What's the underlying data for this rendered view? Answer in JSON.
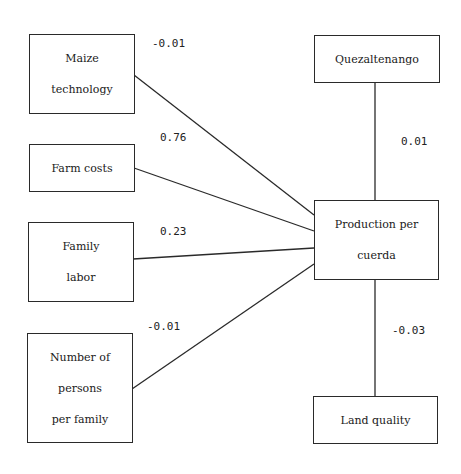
{
  "diagram": {
    "type": "path-diagram",
    "nodes": [
      {
        "id": "maize_technology",
        "lines": [
          "Maize",
          "technology"
        ]
      },
      {
        "id": "farm_costs",
        "lines": [
          "Farm costs"
        ]
      },
      {
        "id": "family_labor",
        "lines": [
          "Family",
          "labor"
        ]
      },
      {
        "id": "persons_per_family",
        "lines": [
          "Number of",
          "persons",
          "per family"
        ]
      },
      {
        "id": "quezaltenango",
        "lines": [
          "Quezaltenango"
        ]
      },
      {
        "id": "production_per_cuerda",
        "lines": [
          "Production per",
          "cuerda"
        ]
      },
      {
        "id": "land_quality",
        "lines": [
          "Land quality"
        ]
      }
    ],
    "edges": [
      {
        "from": "maize_technology",
        "to": "production_per_cuerda",
        "coefficient": "-0.01"
      },
      {
        "from": "farm_costs",
        "to": "production_per_cuerda",
        "coefficient": "0.76"
      },
      {
        "from": "family_labor",
        "to": "production_per_cuerda",
        "coefficient": "0.23"
      },
      {
        "from": "persons_per_family",
        "to": "production_per_cuerda",
        "coefficient": "-0.01"
      },
      {
        "from": "quezaltenango",
        "to": "production_per_cuerda",
        "coefficient": "0.01"
      },
      {
        "from": "land_quality",
        "to": "production_per_cuerda",
        "coefficient": "-0.03"
      }
    ]
  },
  "colors": {
    "line": "#2a2a2a",
    "background": "#ffffff"
  }
}
